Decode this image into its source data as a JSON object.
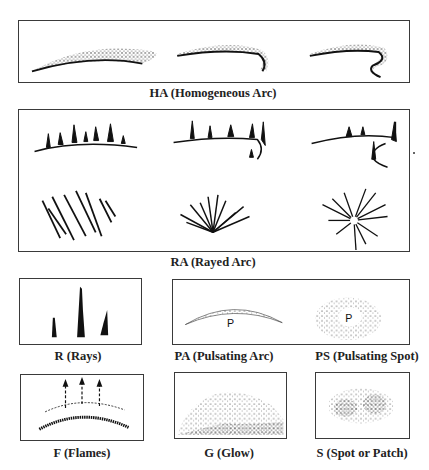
{
  "figure": {
    "panels": [
      {
        "id": "HA",
        "label": "HA (Homogeneous Arc)",
        "examples": [
          "simple arc",
          "arc with fold",
          "arc with curl"
        ]
      },
      {
        "id": "RA",
        "label": "RA (Rayed Arc)",
        "examples": [
          "rayed arc",
          "rayed arc with fold",
          "rayed arc with curl",
          "rayed band",
          "drapery",
          "corona"
        ]
      },
      {
        "id": "R",
        "label": "R (Rays)"
      },
      {
        "id": "PA",
        "label": "PA (Pulsating Arc)",
        "marker": "P"
      },
      {
        "id": "PS",
        "label": "PS (Pulsating Spot)",
        "marker": "P"
      },
      {
        "id": "F",
        "label": "F (Flames)"
      },
      {
        "id": "G",
        "label": "G (Glow)"
      },
      {
        "id": "S",
        "label": "S (Spot or Patch)"
      }
    ]
  },
  "colors": {
    "ink": "#1a1a1a",
    "border": "#3a3a3a",
    "background": "#ffffff"
  }
}
